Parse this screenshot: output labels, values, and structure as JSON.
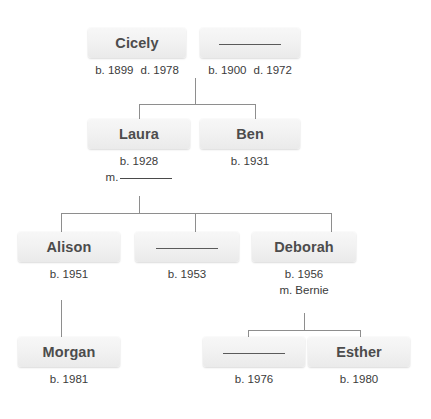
{
  "diagram": {
    "blank_name_placeholder": "",
    "colors": {
      "box_fill_top": "#f7f7f7",
      "box_fill_bottom": "#eaeaea",
      "name_text": "#4c4c4c",
      "date_text": "#3b3b3b",
      "connector": "#8e8e8e",
      "background": "#ffffff"
    }
  },
  "people": [
    {
      "id": "cicely",
      "name": "Cicely",
      "is_blank": false,
      "born": "b. 1899",
      "died": "d. 1978",
      "marriage": "",
      "generation": 1
    },
    {
      "id": "spouse-1900",
      "name": "",
      "is_blank": true,
      "born": "b. 1900",
      "died": "d. 1972",
      "marriage": "",
      "generation": 1
    },
    {
      "id": "laura",
      "name": "Laura",
      "is_blank": false,
      "born": "b. 1928",
      "died": "",
      "marriage": "m.",
      "marriage_blank": true,
      "generation": 2
    },
    {
      "id": "ben",
      "name": "Ben",
      "is_blank": false,
      "born": "b. 1931",
      "died": "",
      "marriage": "",
      "generation": 2
    },
    {
      "id": "alison",
      "name": "Alison",
      "is_blank": false,
      "born": "b. 1951",
      "died": "",
      "marriage": "",
      "generation": 3
    },
    {
      "id": "child-1953",
      "name": "",
      "is_blank": true,
      "born": "b. 1953",
      "died": "",
      "marriage": "",
      "generation": 3
    },
    {
      "id": "deborah",
      "name": "Deborah",
      "is_blank": false,
      "born": "b. 1956",
      "died": "",
      "marriage": "m. Bernie",
      "marriage_blank": false,
      "generation": 3
    },
    {
      "id": "morgan",
      "name": "Morgan",
      "is_blank": false,
      "born": "b. 1981",
      "died": "",
      "marriage": "",
      "generation": 4
    },
    {
      "id": "child-1976",
      "name": "",
      "is_blank": true,
      "born": "b. 1976",
      "died": "",
      "marriage": "",
      "generation": 4
    },
    {
      "id": "esther",
      "name": "Esther",
      "is_blank": false,
      "born": "b. 1980",
      "died": "",
      "marriage": "",
      "generation": 4
    }
  ]
}
